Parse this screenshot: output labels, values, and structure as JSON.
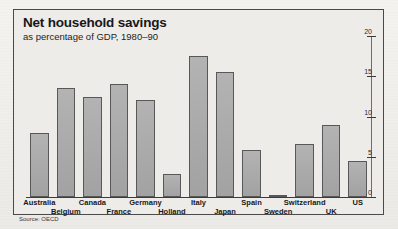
{
  "chart_data": {
    "type": "bar",
    "title": "Net household savings",
    "subtitle": "as percentage of GDP, 1980–90",
    "source": "Source: OECD",
    "xlabel": "",
    "ylabel": "",
    "ylim": [
      0,
      20
    ],
    "yticks": [
      0,
      5,
      10,
      15,
      20
    ],
    "ytick_labels": [
      "0",
      "5",
      "10",
      "15",
      "20"
    ],
    "y_axis_position": "right",
    "grid": false,
    "legend": null,
    "label_rows": [
      0,
      1,
      0,
      1,
      0,
      1,
      0,
      1,
      0,
      1,
      0,
      1,
      0
    ],
    "categories": [
      "Australia",
      "Belgium",
      "Canada",
      "France",
      "Germany",
      "Holland",
      "Italy",
      "Japan",
      "Spain",
      "Sweden",
      "Switzerland",
      "UK",
      "US"
    ],
    "values": [
      8.0,
      13.6,
      12.4,
      14.0,
      12.1,
      2.9,
      17.5,
      15.5,
      5.9,
      0.3,
      6.6,
      9.0,
      4.5
    ],
    "bar_color": "#a8a8a8",
    "bar_edge_color": "#585858"
  },
  "figure": {
    "background": "#f2f1ee",
    "panel_background": "#eeece8",
    "frame_color": "#4a4a4a",
    "axis_color": "#3c3c3c",
    "text_color": "#17171a"
  }
}
